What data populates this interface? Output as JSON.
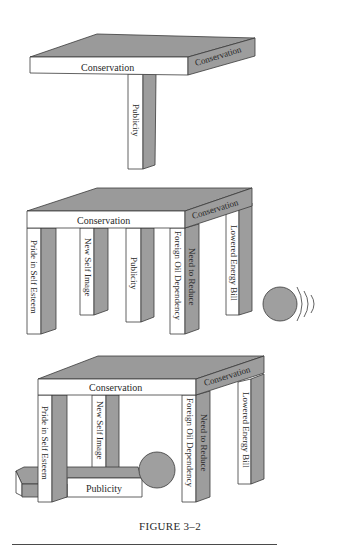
{
  "figure": {
    "caption": "FIGURE 3–2",
    "panels": [
      {
        "id": "panel-1",
        "description": "Table of Conservation supported by a single leg",
        "tabletop_front_label": "Conservation",
        "tabletop_side_label": "Conservation",
        "legs": [
          "Publicity"
        ]
      },
      {
        "id": "panel-2",
        "description": "Table of Conservation supported by five legs with a ball rolling toward it",
        "tabletop_front_label": "Conservation",
        "tabletop_side_label": "Conservation",
        "legs": [
          "Pride in Self Esteem",
          "New Self Image",
          "Publicity",
          "Foreign Oil Dependency",
          "Need to Reduce",
          "Lowered Energy Bill"
        ],
        "ball": "rolling-ball"
      },
      {
        "id": "panel-3",
        "description": "Ball has knocked over the Publicity leg; table still stands",
        "tabletop_front_label": "Conservation",
        "tabletop_side_label": "Conservation",
        "legs": [
          "Pride in Self Esteem",
          "New Self Image",
          "Foreign Oil Dependency",
          "Need to Reduce",
          "Lowered Energy Bill"
        ],
        "fallen_leg": "Publicity",
        "ball": "stopped-ball"
      }
    ]
  },
  "labels": {
    "p1_front": "Conservation",
    "p1_side": "Conservation",
    "p1_leg": "Publicity",
    "p2_front": "Conservation",
    "p2_side": "Conservation",
    "p2_leg1": "Pride in Self Esteem",
    "p2_leg2": "New Self Image",
    "p2_leg3": "Publicity",
    "p2_leg4": "Foreign Oil Dependency",
    "p2_leg5": "Need to Reduce",
    "p2_leg6": "Lowered Energy Bill",
    "p3_front": "Conservation",
    "p3_side": "Conservation",
    "p3_leg1": "Pride in Self Esteem",
    "p3_leg2": "New Self Image",
    "p3_leg4": "Foreign Oil Dependency",
    "p3_leg5": "Need to Reduce",
    "p3_leg6": "Lowered Energy Bill",
    "p3_fallen": "Publicity"
  },
  "colors": {
    "shade": "#9a9a9a",
    "face": "#ffffff",
    "stroke": "#3a3a3a",
    "text": "#2a2a2a"
  }
}
